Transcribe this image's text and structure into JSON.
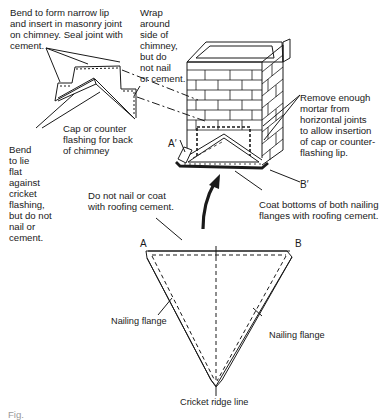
{
  "diagram": {
    "type": "technical-illustration",
    "labels": {
      "bend_lip": "Bend to form narrow lip\nand insert in masonry joint\non chimney. Seal joint with\ncement.",
      "wrap_side": "Wrap\naround\nside of\nchimney,\nbut do\nnot nail\nor cement.",
      "remove_mortar": "Remove enough\nmortar from\nhorizontal joints\nto allow insertion\nof cap or counter-\nflashing lip.",
      "cap_counter": "Cap or counter\nflashing for back\nof chimney",
      "bend_flat": "Bend\nto lie\nflat\nagainst\ncricket\nflashing,\nbut do not\nnail or\ncement.",
      "do_not_nail": "Do not nail or coat\nwith roofing cement.",
      "coat_bottoms": "Coat bottoms of both nailing\nflanges with roofing cement.",
      "nailing_flange_left": "Nailing flange",
      "nailing_flange_right": "Nailing flange",
      "cricket_ridge": "Cricket ridge line"
    },
    "points": {
      "a_prime": "A′",
      "b_prime": "B′",
      "a": "A",
      "b": "B"
    },
    "caption": "Fig."
  }
}
